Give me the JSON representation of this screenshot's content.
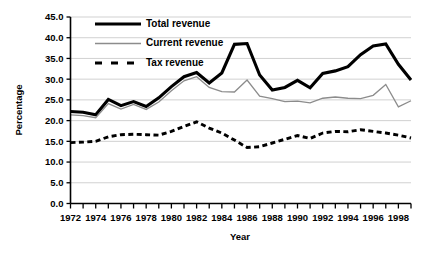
{
  "chart_data": {
    "type": "line",
    "title": "",
    "xlabel": "Year",
    "ylabel": "Percentage",
    "xlim": [
      1972,
      1999
    ],
    "ylim": [
      0.0,
      45.0
    ],
    "ytick_step": 5.0,
    "grid": true,
    "legend_position": "top-left-inside",
    "x": [
      1972,
      1973,
      1974,
      1975,
      1976,
      1977,
      1978,
      1979,
      1980,
      1981,
      1982,
      1983,
      1984,
      1985,
      1986,
      1987,
      1988,
      1989,
      1990,
      1991,
      1992,
      1993,
      1994,
      1995,
      1996,
      1997,
      1998,
      1999
    ],
    "xticks": [
      1972,
      1973,
      1974,
      1975,
      1976,
      1977,
      1978,
      1979,
      1980,
      1981,
      1982,
      1983,
      1984,
      1985,
      1986,
      1987,
      1988,
      1989,
      1990,
      1991,
      1992,
      1993,
      1994,
      1995,
      1996,
      1997,
      1998,
      1999
    ],
    "xtick_labels": [
      "1972",
      "",
      "1974",
      "",
      "1976",
      "",
      "1978",
      "",
      "1980",
      "",
      "1982",
      "",
      "1984",
      "",
      "1986",
      "",
      "1988",
      "",
      "1990",
      "",
      "1992",
      "",
      "1994",
      "",
      "1996",
      "",
      "1998",
      ""
    ],
    "yticks": [
      0.0,
      5.0,
      10.0,
      15.0,
      20.0,
      25.0,
      30.0,
      35.0,
      40.0,
      45.0
    ],
    "ytick_labels": [
      "0.0",
      "5.0",
      "10.0",
      "15.0",
      "20.0",
      "25.0",
      "30.0",
      "35.0",
      "40.0",
      "45.0"
    ],
    "series": [
      {
        "name": "Total revenue",
        "style": "solid-thick",
        "color": "#000000",
        "values": [
          22.2,
          22.0,
          21.4,
          25.1,
          23.6,
          24.6,
          23.4,
          25.5,
          28.2,
          30.6,
          31.6,
          29.1,
          31.5,
          38.4,
          38.6,
          31.0,
          27.4,
          28.0,
          29.7,
          27.9,
          31.4,
          32.0,
          33.0,
          35.9,
          38.0,
          38.5,
          33.6,
          29.8
        ]
      },
      {
        "name": "Current revenue",
        "style": "solid-thin",
        "color": "#8c8c8c",
        "values": [
          21.4,
          21.2,
          20.7,
          24.1,
          22.8,
          23.9,
          22.7,
          24.5,
          27.2,
          29.6,
          30.6,
          28.0,
          27.0,
          26.9,
          29.8,
          25.9,
          25.3,
          24.6,
          24.7,
          24.3,
          25.4,
          25.7,
          25.4,
          25.3,
          26.1,
          28.7,
          23.3,
          24.8
        ]
      },
      {
        "name": "Tax revenue",
        "style": "dashed",
        "color": "#000000",
        "values": [
          14.7,
          14.8,
          15.0,
          16.1,
          16.6,
          16.7,
          16.6,
          16.5,
          17.4,
          18.6,
          19.7,
          18.2,
          17.0,
          15.3,
          13.5,
          13.7,
          14.6,
          15.5,
          16.4,
          15.7,
          17.0,
          17.4,
          17.3,
          17.8,
          17.4,
          17.0,
          16.5,
          15.8
        ]
      }
    ]
  },
  "legend": {
    "items": [
      {
        "label": "Total revenue",
        "style": "solid-thick",
        "color": "#000000"
      },
      {
        "label": "Current revenue",
        "style": "solid-thin",
        "color": "#8c8c8c"
      },
      {
        "label": "Tax revenue",
        "style": "dashed",
        "color": "#000000"
      }
    ]
  },
  "axes": {
    "x_title": "Year",
    "y_title": "Percentage"
  },
  "colors": {
    "total": "#000000",
    "current": "#8c8c8c",
    "tax": "#000000",
    "grid": "#bdbdbd",
    "axis": "#000000",
    "background": "#ffffff"
  }
}
